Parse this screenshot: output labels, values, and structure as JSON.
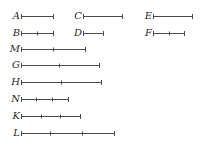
{
  "diagram": {
    "type": "line-segments",
    "stroke_color": "#4a4a4a",
    "label_color": "#2a2a2a",
    "segments": [
      {
        "label": "A",
        "x1": 21,
        "x2": 53,
        "y": 16,
        "ticks": []
      },
      {
        "label": "B",
        "x1": 21,
        "x2": 53,
        "y": 33,
        "ticks": [
          37
        ]
      },
      {
        "label": "C",
        "x1": 83,
        "x2": 122,
        "y": 16,
        "ticks": []
      },
      {
        "label": "D",
        "x1": 83,
        "x2": 103,
        "y": 33,
        "ticks": []
      },
      {
        "label": "E",
        "x1": 153,
        "x2": 192,
        "y": 16,
        "ticks": []
      },
      {
        "label": "F",
        "x1": 153,
        "x2": 184,
        "y": 33,
        "ticks": [
          169
        ]
      },
      {
        "label": "M",
        "x1": 21,
        "x2": 85,
        "y": 49,
        "ticks": [
          53
        ]
      },
      {
        "label": "G",
        "x1": 21,
        "x2": 99,
        "y": 65,
        "ticks": [
          59
        ]
      },
      {
        "label": "H",
        "x1": 21,
        "x2": 101,
        "y": 82,
        "ticks": [
          61
        ]
      },
      {
        "label": "N",
        "x1": 21,
        "x2": 68,
        "y": 99,
        "ticks": [
          36,
          52
        ]
      },
      {
        "label": "K",
        "x1": 21,
        "x2": 80,
        "y": 116,
        "ticks": [
          41,
          60
        ]
      },
      {
        "label": "L",
        "x1": 21,
        "x2": 114,
        "y": 133,
        "ticks": [
          50,
          82
        ]
      }
    ]
  }
}
